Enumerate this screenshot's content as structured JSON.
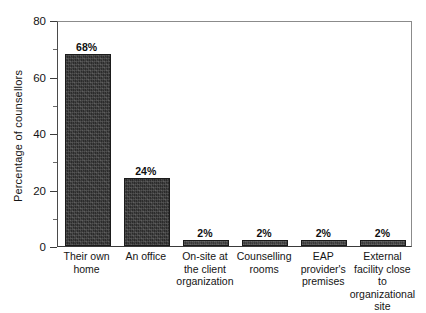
{
  "chart_data": {
    "type": "bar",
    "title": "",
    "xlabel": "",
    "ylabel": "Percentage of counsellors",
    "ylim": [
      0,
      80
    ],
    "yticks": [
      0,
      20,
      40,
      60,
      80
    ],
    "yticks_minor": [
      10,
      30,
      50,
      70
    ],
    "grid": false,
    "legend": null,
    "value_suffix": "%",
    "categories": [
      "Their own\nhome",
      "An office",
      "On-site at\nthe client\norganization",
      "Counselling\nrooms",
      "EAP\nprovider's\npremises",
      "External\nfacility close\nto\norganizational\nsite"
    ],
    "values": [
      68,
      24,
      2,
      2,
      2,
      2
    ],
    "data_labels": [
      "68%",
      "24%",
      "2%",
      "2%",
      "2%",
      "2%"
    ],
    "bar_color": "#2b2b2b",
    "axis_color": "#3a3a3a"
  },
  "axis": {
    "y_tick_labels": [
      "0",
      "20",
      "40",
      "60",
      "80"
    ]
  }
}
